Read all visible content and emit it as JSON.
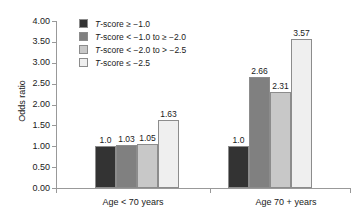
{
  "chart_data": {
    "type": "bar",
    "title": "",
    "xlabel": "",
    "ylabel": "Odds ratio",
    "categories": [
      "Age < 70 years",
      "Age 70 + years"
    ],
    "ylim": [
      0.0,
      4.0
    ],
    "ytick_step": 0.5,
    "ytick_labels": [
      "4.00",
      "3.50",
      "3.00",
      "2.50",
      "2.00",
      "1.50",
      "1.00",
      "0.50",
      "0.00"
    ],
    "ytick_values": [
      4.0,
      3.5,
      3.0,
      2.5,
      2.0,
      1.5,
      1.0,
      0.5,
      0.0
    ],
    "grid": false,
    "legend_position": "top-center",
    "series": [
      {
        "name": "T-score ≥ −1.0",
        "color": "#333333",
        "values": [
          1.0,
          1.0
        ],
        "labels": [
          "1.0",
          "1.0"
        ]
      },
      {
        "name": "T-score < −1.0 to ≥ −2.0",
        "color": "#808080",
        "values": [
          1.03,
          2.66
        ],
        "labels": [
          "1.03",
          "2.66"
        ]
      },
      {
        "name": "T-score < −2.0 to > −2.5",
        "color": "#c8c8c8",
        "values": [
          1.05,
          2.31
        ],
        "labels": [
          "1.05",
          "2.31"
        ]
      },
      {
        "name": "T-score ≤ −2.5",
        "color": "#efefef",
        "values": [
          1.63,
          3.57
        ],
        "labels": [
          "1.63",
          "3.57"
        ]
      }
    ]
  },
  "legend": {
    "items": [
      {
        "prefix": "T",
        "text": "-score ≥ −1.0",
        "color": "#333333"
      },
      {
        "prefix": "T",
        "text": "-score < −1.0 to ≥ −2.0",
        "color": "#808080"
      },
      {
        "prefix": "T",
        "text": "-score < −2.0 to > −2.5",
        "color": "#c8c8c8"
      },
      {
        "prefix": "T",
        "text": "-score ≤ −2.5",
        "color": "#efefef"
      }
    ]
  },
  "axes": {
    "y_title": "Odds ratio",
    "y_labels": [
      "4.00",
      "3.50",
      "3.00",
      "2.50",
      "2.00",
      "1.50",
      "1.00",
      "0.50",
      "0.00"
    ],
    "x_labels": [
      "Age < 70 years",
      "Age 70 + years"
    ]
  },
  "bar_values": {
    "group1": [
      "1.0",
      "1.03",
      "1.05",
      "1.63"
    ],
    "group2": [
      "1.0",
      "2.66",
      "2.31",
      "3.57"
    ]
  }
}
